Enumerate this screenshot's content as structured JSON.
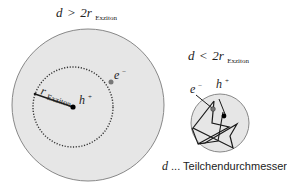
{
  "large_particle": {
    "condition_var": "d",
    "condition_op": ">",
    "condition_coef": "2r",
    "condition_sub": "Exziton",
    "radius_label": "r",
    "radius_sub": "Exziton",
    "hole_label": "h",
    "hole_sup": "+",
    "electron_label": "e",
    "electron_sup": "−"
  },
  "small_particle": {
    "condition_var": "d",
    "condition_op": "<",
    "condition_coef": "2r",
    "condition_sub": "Exziton",
    "hole_label": "h",
    "hole_sup": "+",
    "electron_label": "e",
    "electron_sup": "−"
  },
  "legend": {
    "var": "d",
    "text": " ... Teilchendurchmesser"
  },
  "colors": {
    "particle_fill": "#e6e6e6",
    "particle_stroke": "#888888",
    "line": "#1a1a1a",
    "electron": "#777777"
  }
}
